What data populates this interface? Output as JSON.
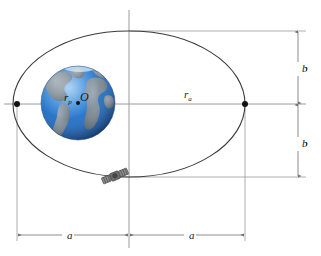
{
  "figure": {
    "background_color": "#ffffff",
    "width": 321,
    "height": 256
  },
  "labels": {
    "perigee_radius": {
      "symbol": "r",
      "subscript": "p",
      "x": 66,
      "y": 100
    },
    "center_point": {
      "symbol": "O",
      "subscript": "",
      "x": 81,
      "y": 100
    },
    "apogee_radius": {
      "symbol": "r",
      "subscript": "a",
      "x": 186,
      "y": 97
    },
    "semi_minor_top": {
      "symbol": "b",
      "subscript": "",
      "x": 303,
      "y": 71
    },
    "semi_minor_bottom": {
      "symbol": "b",
      "subscript": "",
      "x": 303,
      "y": 146
    },
    "semi_major_left": {
      "symbol": "a",
      "subscript": "",
      "x": 69,
      "y": 232
    },
    "semi_major_right": {
      "symbol": "a",
      "subscript": "",
      "x": 191,
      "y": 232
    }
  },
  "geometry": {
    "ellipse": {
      "cx": 129,
      "cy": 104,
      "rx": 116,
      "ry": 73
    },
    "earth": {
      "cx": 78,
      "cy": 103,
      "r": 37
    },
    "focus_dot": {
      "cx": 78,
      "cy": 103,
      "r": 2.0
    },
    "perigee_vertex": {
      "cx": 17,
      "cy": 104,
      "r": 3.0
    },
    "apogee_vertex": {
      "cx": 245,
      "cy": 104,
      "r": 3.0
    },
    "satellite": {
      "cx": 115,
      "cy": 176,
      "size": 16,
      "rotation": -22
    },
    "major_axis": {
      "x1": 4,
      "y1": 104,
      "x2": 306,
      "y2": 104
    },
    "minor_axis": {
      "x1": 129,
      "y1": 10,
      "x2": 129,
      "y2": 248
    },
    "tangent_top": {
      "x1": 129,
      "y1": 31,
      "x2": 306,
      "y2": 31
    },
    "tangent_bottom": {
      "x1": 110,
      "y1": 177,
      "x2": 306,
      "y2": 177
    },
    "vertical_dim_x": 298,
    "horizontal_dim_y": 235,
    "ext_left_x": 17,
    "ext_right_x": 245
  },
  "colors": {
    "ocean_deep": "#1f62b8",
    "ocean_mid": "#2f7fd4",
    "ocean_light": "#6fb0e8",
    "land": "#7e8c98",
    "land_dark": "#5d6b77",
    "outline": "#3a3a3a",
    "dimension": "#6e6e6e",
    "axis": "#9a9a9a",
    "satellite_body": "#6b6b6b",
    "satellite_dark": "#3c3c3c"
  }
}
